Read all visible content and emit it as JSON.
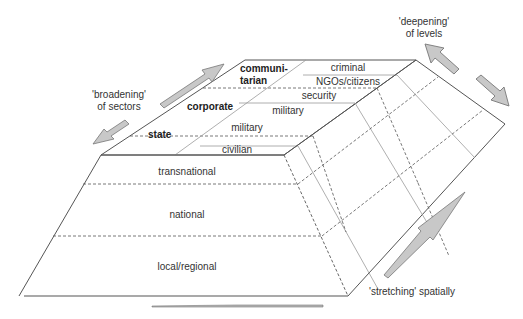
{
  "diagram": {
    "type": "3D slab / pyramid frustum diagram of security levels and sectors",
    "colors": {
      "outline": "#555555",
      "inner_line": "#9a9a9a",
      "dashed_line": "#555555",
      "arrow_fill": "#c8c8c8",
      "arrow_stroke": "#777777",
      "text": "#333333"
    },
    "sectors": {
      "state": {
        "label": "state",
        "subsectors": [
          "military",
          "civilian"
        ]
      },
      "corporate": {
        "label": "corporate",
        "subsectors": [
          "security",
          "military"
        ]
      },
      "communitarian": {
        "label_line1": "communi-",
        "label_line2": "tarian",
        "subsectors": [
          "criminal",
          "NGOs/citizens"
        ]
      }
    },
    "levels": [
      "transnational",
      "national",
      "local/regional"
    ],
    "annotations": {
      "broadening_line1": "'broadening'",
      "broadening_line2": "of sectors",
      "deepening_line1": "'deepening'",
      "deepening_line2": "of levels",
      "stretching": "'stretching' spatially"
    },
    "arrows": [
      {
        "name": "broadening-arrow-up",
        "direction": "up-right"
      },
      {
        "name": "broadening-arrow-down",
        "direction": "down-left"
      },
      {
        "name": "deepening-arrow-up",
        "direction": "up-left"
      },
      {
        "name": "deepening-arrow-down",
        "direction": "down-right"
      },
      {
        "name": "stretching-arrow",
        "direction": "up-right"
      },
      {
        "name": "horizontal-stretch-arrow",
        "direction": "left-right"
      }
    ]
  }
}
